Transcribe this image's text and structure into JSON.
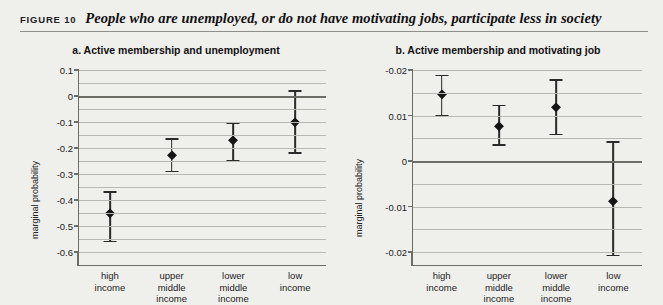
{
  "figure": {
    "label": "FIGURE 10",
    "caption": "People who are unemployed, or do not have motivating jobs, participate less in society"
  },
  "chart_data": [
    {
      "type": "scatter",
      "panel": "a",
      "title": "a.  Active membership and unemployment",
      "xlabel": "",
      "ylabel": "marginal probability",
      "ylim": [
        -0.6,
        0.1
      ],
      "ytick_labels": [
        "0.1",
        "0",
        "-0.1",
        "-0.2",
        "-0.3",
        "-0.4",
        "-0.5",
        "-0.6"
      ],
      "ytick_values": [
        0.1,
        0,
        -0.1,
        -0.2,
        -0.3,
        -0.4,
        -0.5,
        -0.6
      ],
      "grid": true,
      "zero_line": 0,
      "legend": "none",
      "categories": [
        "high income",
        "upper middle income",
        "lower middle income",
        "low income"
      ],
      "values": [
        -0.45,
        -0.225,
        -0.17,
        -0.1
      ],
      "error_low": [
        -0.56,
        -0.29,
        -0.25,
        -0.22
      ],
      "error_high": [
        -0.37,
        -0.165,
        -0.105,
        0.02
      ]
    },
    {
      "type": "scatter",
      "panel": "b",
      "title": "b.  Active membership and motivating job",
      "xlabel": "",
      "ylabel": "marginal probability",
      "ylim": [
        -0.02,
        0.02
      ],
      "ytick_labels": [
        "-0.02",
        "0.01",
        "0",
        "-0.01",
        "-0.02"
      ],
      "ytick_values": [
        0.02,
        0.01,
        0,
        -0.01,
        -0.02
      ],
      "grid": true,
      "zero_line": 0,
      "legend": "none",
      "categories": [
        "high income",
        "upper middle income",
        "lower middle income",
        "low income"
      ],
      "values": [
        0.0148,
        0.0077,
        0.0118,
        -0.0088
      ],
      "error_low": [
        0.0099,
        0.0035,
        0.0058,
        -0.0208
      ],
      "error_high": [
        0.0188,
        0.0122,
        0.0178,
        0.0042
      ]
    }
  ],
  "panel_a": {
    "title": "a.  Active membership and unemployment",
    "ylabel": "marginal probability",
    "yticks": [
      "0.1",
      "0",
      "-0.1",
      "-0.2",
      "-0.3",
      "-0.4",
      "-0.5",
      "-0.6"
    ],
    "xlabels": [
      {
        "line1": "high",
        "line2": "income",
        "line3": ""
      },
      {
        "line1": "upper",
        "line2": "middle",
        "line3": "income"
      },
      {
        "line1": "lower",
        "line2": "middle",
        "line3": "income"
      },
      {
        "line1": "low",
        "line2": "income",
        "line3": ""
      }
    ]
  },
  "panel_b": {
    "title": "b.  Active membership and motivating job",
    "ylabel": "marginal probability",
    "yticks": [
      "-0.02",
      "0.01",
      "0",
      "-0.01",
      "-0.02"
    ],
    "xlabels": [
      {
        "line1": "high",
        "line2": "income",
        "line3": ""
      },
      {
        "line1": "upper",
        "line2": "middle",
        "line3": "income"
      },
      {
        "line1": "lower",
        "line2": "middle",
        "line3": "income"
      },
      {
        "line1": "low",
        "line2": "income",
        "line3": ""
      }
    ]
  },
  "colors": {
    "marker": "#151515",
    "axis": "#6d6d68",
    "grid": "#b9b9b4",
    "background": "#efefec"
  }
}
